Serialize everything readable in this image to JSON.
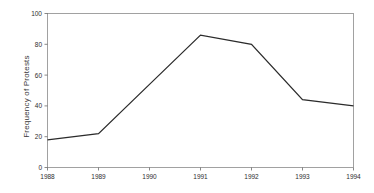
{
  "chart_data": {
    "type": "line",
    "title": "",
    "xlabel": "",
    "ylabel": "Frequency of Protests",
    "x": [
      1988,
      1989,
      1990,
      1991,
      1992,
      1993,
      1994
    ],
    "categories": [
      "1988",
      "1989",
      "1990",
      "1991",
      "1992",
      "1993",
      "1994"
    ],
    "values": [
      18,
      22,
      54,
      86,
      80,
      44,
      40
    ],
    "series": [
      {
        "name": "Frequency of Protests",
        "values": [
          18,
          22,
          54,
          86,
          80,
          44,
          40
        ]
      }
    ],
    "xlim": [
      1988,
      1994
    ],
    "ylim": [
      0,
      100
    ],
    "yticks": [
      0,
      20,
      40,
      60,
      80,
      100
    ],
    "ytick_labels": [
      "0",
      "20",
      "40",
      "60",
      "80",
      "100"
    ],
    "xticks": [
      1988,
      1989,
      1990,
      1991,
      1992,
      1993,
      1994
    ],
    "xtick_labels": [
      "1988",
      "1989",
      "1990",
      "1991",
      "1992",
      "1993",
      "1994"
    ],
    "grid": false,
    "legend": false,
    "legend_position": "none",
    "line_color": "#2b2b2b",
    "axis_color": "#8a8a8a",
    "text_color": "#2e2e2e",
    "background_color": "#ffffff",
    "annotations": []
  },
  "axis": {
    "ylabel": "Frequency of Protests"
  }
}
